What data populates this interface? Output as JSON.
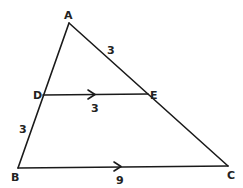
{
  "diagram": {
    "type": "triangle-with-parallel-segment",
    "points": {
      "A": {
        "label": "A",
        "x": 69,
        "y": 23,
        "lx": 64,
        "ly": 19
      },
      "B": {
        "label": "B",
        "x": 18,
        "y": 168,
        "lx": 11,
        "ly": 181
      },
      "C": {
        "label": "C",
        "x": 228,
        "y": 166,
        "lx": 227,
        "ly": 179
      },
      "D": {
        "label": "D",
        "x": 43,
        "y": 95,
        "lx": 33,
        "ly": 99
      },
      "E": {
        "label": "E",
        "x": 148,
        "y": 94,
        "lx": 150,
        "ly": 99
      }
    },
    "segments": [
      {
        "from": "A",
        "to": "B"
      },
      {
        "from": "A",
        "to": "C"
      },
      {
        "from": "B",
        "to": "C"
      },
      {
        "from": "D",
        "to": "E"
      }
    ],
    "parallel_marks": [
      {
        "segment": "DE",
        "x": 93,
        "y": 95
      },
      {
        "segment": "BC",
        "x": 119,
        "y": 167
      }
    ],
    "measurements": [
      {
        "segment": "AE",
        "value": "3",
        "x": 107,
        "y": 54
      },
      {
        "segment": "DE",
        "value": "3",
        "x": 91,
        "y": 112
      },
      {
        "segment": "BD",
        "value": "3",
        "x": 19,
        "y": 133
      },
      {
        "segment": "BC",
        "value": "9",
        "x": 116,
        "y": 184
      }
    ]
  }
}
